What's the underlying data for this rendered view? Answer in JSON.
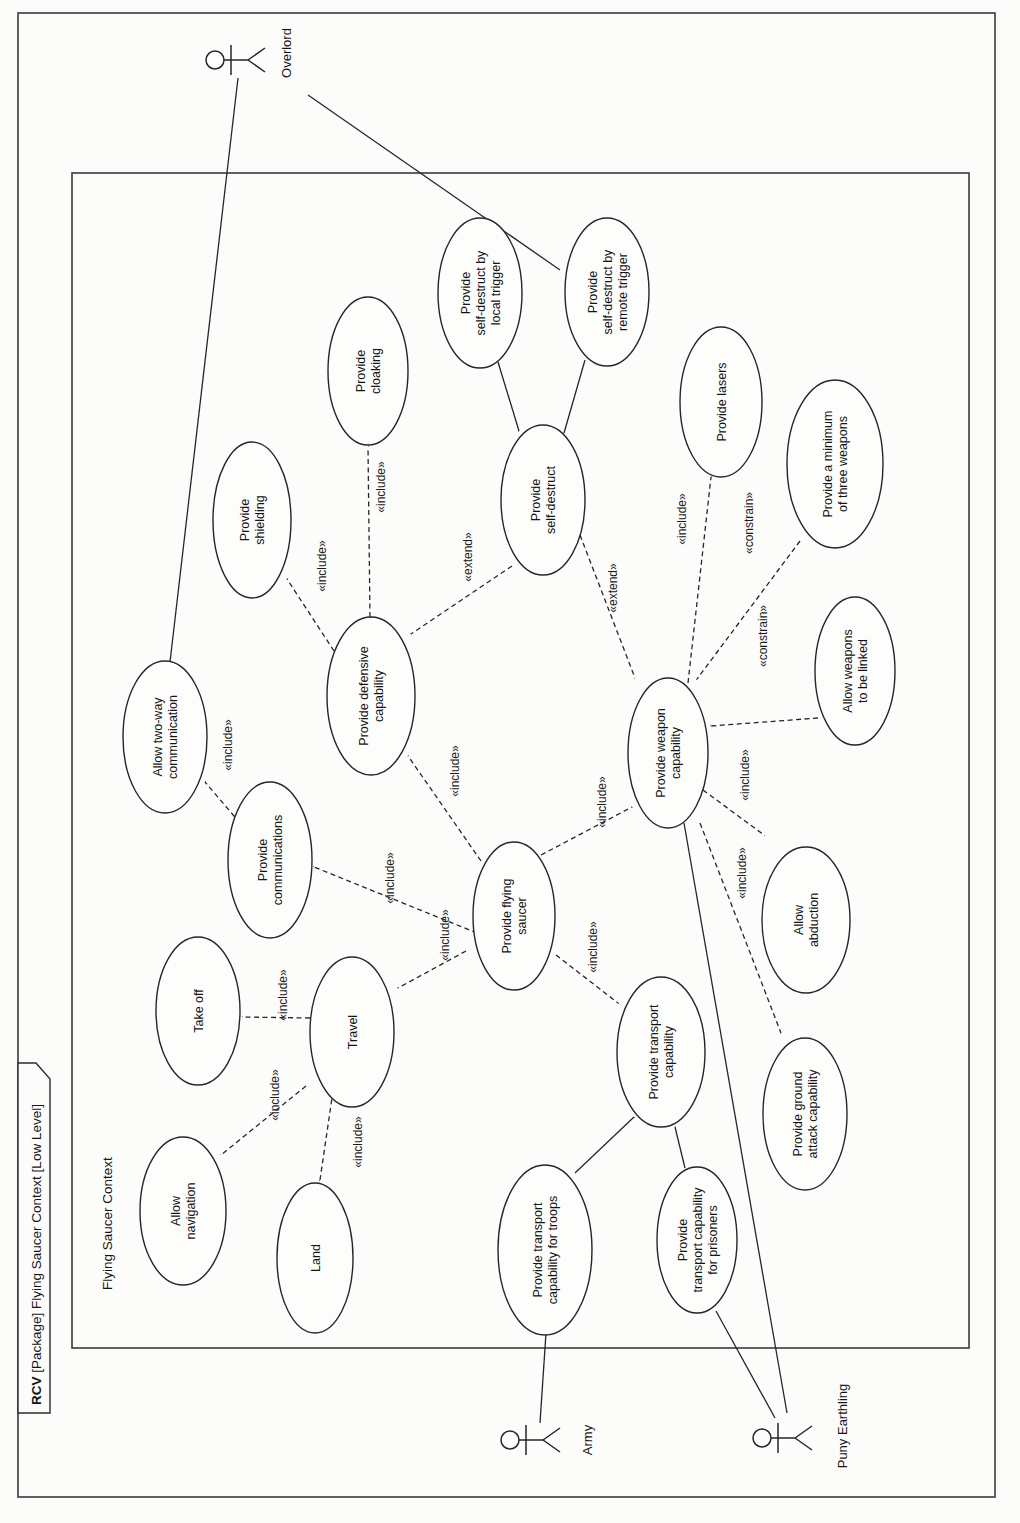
{
  "frame": {
    "title_bold": "RCV",
    "title_rest": " [Package] Flying Saucer Context [Low Level]",
    "boundary_label": "Flying Saucer Context"
  },
  "actors": [
    {
      "name": "Overlord"
    },
    {
      "name": "Army"
    },
    {
      "name": "Puny Earthling"
    }
  ],
  "stereotypes": {
    "include": "«include»",
    "extend": "«extend»",
    "constrain": "«constrain»"
  },
  "usecases": [
    {
      "id": "allow-two-way-communication",
      "lines": [
        "Allow two-way",
        "communication"
      ]
    },
    {
      "id": "provide-communications",
      "lines": [
        "Provide",
        "communications"
      ]
    },
    {
      "id": "take-off",
      "lines": [
        "Take off"
      ]
    },
    {
      "id": "allow-navigation",
      "lines": [
        "Allow",
        "navigation"
      ]
    },
    {
      "id": "land",
      "lines": [
        "Land"
      ]
    },
    {
      "id": "travel",
      "lines": [
        "Travel"
      ]
    },
    {
      "id": "provide-shielding",
      "lines": [
        "Provide",
        "shielding"
      ]
    },
    {
      "id": "provide-cloaking",
      "lines": [
        "Provide",
        "cloaking"
      ]
    },
    {
      "id": "provide-defensive-capability",
      "lines": [
        "Provide defensive",
        "capability"
      ]
    },
    {
      "id": "provide-self-destruct",
      "lines": [
        "Provide",
        "self-destruct"
      ]
    },
    {
      "id": "provide-self-destruct-local",
      "lines": [
        "Provide",
        "self-destruct by",
        "local trigger"
      ]
    },
    {
      "id": "provide-self-destruct-remote",
      "lines": [
        "Provide",
        "self-destruct by",
        "remote trigger"
      ]
    },
    {
      "id": "provide-lasers",
      "lines": [
        "Provide lasers"
      ]
    },
    {
      "id": "provide-minimum-three-weapons",
      "lines": [
        "Provide a minimum",
        "of three weapons"
      ]
    },
    {
      "id": "allow-weapons-linked",
      "lines": [
        "Allow weapons",
        "to be linked"
      ]
    },
    {
      "id": "provide-weapon-capability",
      "lines": [
        "Provide weapon",
        "capability"
      ]
    },
    {
      "id": "allow-abduction",
      "lines": [
        "Allow",
        "abduction"
      ]
    },
    {
      "id": "provide-ground-attack",
      "lines": [
        "Provide ground",
        "attack capability"
      ]
    },
    {
      "id": "provide-flying-saucer",
      "lines": [
        "Provide flying",
        "saucer"
      ]
    },
    {
      "id": "provide-transport-capability",
      "lines": [
        "Provide transport",
        "capability"
      ]
    },
    {
      "id": "provide-transport-troops",
      "lines": [
        "Provide transport",
        "capability for troops"
      ]
    },
    {
      "id": "provide-transport-prisoners",
      "lines": [
        "Provide",
        "transport capability",
        "for prisoners"
      ]
    }
  ],
  "connections": [
    {
      "from": "Overlord",
      "to": "Allow two-way communication",
      "type": "association",
      "label": ""
    },
    {
      "from": "Overlord",
      "to": "Provide self-destruct by remote trigger",
      "type": "association",
      "label": ""
    },
    {
      "from": "Army",
      "to": "Provide transport capability for troops",
      "type": "association",
      "label": ""
    },
    {
      "from": "Puny Earthling",
      "to": "Provide transport capability for prisoners",
      "type": "association",
      "label": ""
    },
    {
      "from": "Puny Earthling",
      "to": "Provide weapon capability",
      "type": "association",
      "label": ""
    },
    {
      "from": "Provide self-destruct by local trigger",
      "to": "Provide self-destruct",
      "type": "generalization",
      "label": ""
    },
    {
      "from": "Provide self-destruct by remote trigger",
      "to": "Provide self-destruct",
      "type": "generalization",
      "label": ""
    },
    {
      "from": "Provide transport capability for troops",
      "to": "Provide transport capability",
      "type": "generalization",
      "label": ""
    },
    {
      "from": "Provide transport capability for prisoners",
      "to": "Provide transport capability",
      "type": "generalization",
      "label": ""
    },
    {
      "from": "Provide flying saucer",
      "to": "Provide defensive capability",
      "type": "include",
      "label": "«include»"
    },
    {
      "from": "Provide flying saucer",
      "to": "Provide weapon capability",
      "type": "include",
      "label": "«include»"
    },
    {
      "from": "Provide flying saucer",
      "to": "Provide communications",
      "type": "include",
      "label": "«include»"
    },
    {
      "from": "Provide flying saucer",
      "to": "Travel",
      "type": "include",
      "label": "«include»"
    },
    {
      "from": "Provide flying saucer",
      "to": "Provide transport capability",
      "type": "include",
      "label": "«include»"
    },
    {
      "from": "Provide defensive capability",
      "to": "Provide shielding",
      "type": "include",
      "label": "«include»"
    },
    {
      "from": "Provide defensive capability",
      "to": "Provide cloaking",
      "type": "include",
      "label": "«include»"
    },
    {
      "from": "Provide self-destruct",
      "to": "Provide defensive capability",
      "type": "extend",
      "label": "«extend»"
    },
    {
      "from": "Provide self-destruct",
      "to": "Provide weapon capability",
      "type": "extend",
      "label": "«extend»"
    },
    {
      "from": "Provide weapon capability",
      "to": "Provide lasers",
      "type": "include",
      "label": "«include»"
    },
    {
      "from": "Provide a minimum of three weapons",
      "to": "Provide weapon capability",
      "type": "constrain",
      "label": "«constrain»"
    },
    {
      "from": "Allow weapons to be linked",
      "to": "Provide weapon capability",
      "type": "constrain",
      "label": "«constrain»"
    },
    {
      "from": "Provide weapon capability",
      "to": "Allow abduction",
      "type": "include",
      "label": "«include»"
    },
    {
      "from": "Provide weapon capability",
      "to": "Provide ground attack capability",
      "type": "include",
      "label": "«include»"
    },
    {
      "from": "Provide communications",
      "to": "Allow two-way communication",
      "type": "include",
      "label": "«include»"
    },
    {
      "from": "Travel",
      "to": "Take off",
      "type": "include",
      "label": "«include»"
    },
    {
      "from": "Travel",
      "to": "Allow navigation",
      "type": "include",
      "label": "«include»"
    },
    {
      "from": "Travel",
      "to": "Land",
      "type": "include",
      "label": "«include»"
    }
  ]
}
